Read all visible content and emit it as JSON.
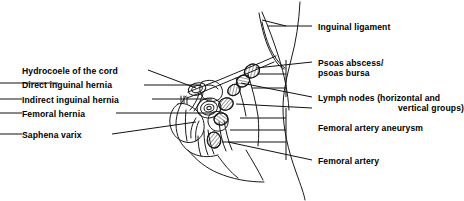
{
  "figure": {
    "title_visible": false,
    "kind": "anatomical-line-drawing",
    "colors": {
      "background": "#ffffff",
      "ink": "#1a1a1a",
      "leader_line": "#111111",
      "text": "#000000"
    },
    "line_width_px": 1.0
  },
  "labels": {
    "left": [
      {
        "id": "hydrocoele-of-the-cord",
        "text": "Hydrocoele of the cord",
        "x": 22,
        "y": 66,
        "leader": {
          "x1": 148,
          "y1": 70,
          "x2": 196,
          "y2": 88
        }
      },
      {
        "id": "direct-inguinal-hernia",
        "text": "Direct inguinal hernia",
        "x": 22,
        "y": 80,
        "leader": {
          "x1": 144,
          "y1": 85,
          "x2": 201,
          "y2": 85
        }
      },
      {
        "id": "indirect-inguinal-hernia",
        "text": "Indirect inguinal hernia",
        "x": 22,
        "y": 95,
        "leader": {
          "x1": 152,
          "y1": 99,
          "x2": 212,
          "y2": 99
        }
      },
      {
        "id": "femoral-hernia",
        "text": "Femoral hernia",
        "x": 22,
        "y": 109,
        "leader": {
          "x1": 116,
          "y1": 113,
          "x2": 214,
          "y2": 113
        }
      },
      {
        "id": "saphena-varix",
        "text": "Saphena varix",
        "x": 22,
        "y": 130,
        "leader": {
          "x1": 112,
          "y1": 134,
          "x2": 196,
          "y2": 122
        }
      }
    ],
    "right": [
      {
        "id": "inguinal-ligament",
        "lines": [
          "Inguinal ligament"
        ],
        "x": 318,
        "y": 22,
        "leader": {
          "x1": 300,
          "y1": 26,
          "x2": 268,
          "y2": 26
        }
      },
      {
        "id": "psoas-abscess-bursa",
        "lines": [
          "Psoas abscess/",
          "psoas bursa"
        ],
        "x": 318,
        "y": 58,
        "leader": {
          "x1": 300,
          "y1": 62,
          "x2": 256,
          "y2": 68
        }
      },
      {
        "id": "lymph-nodes",
        "lines": [
          "Lymph nodes (horizontal and",
          "vertical groups)"
        ],
        "x": 318,
        "y": 93,
        "indent_second_line": true,
        "leader": {
          "x1": 300,
          "y1": 97,
          "x2": 241,
          "y2": 83
        }
      },
      {
        "id": "femoral-artery-aneurysm",
        "lines": [
          "Femoral artery aneurysm"
        ],
        "x": 318,
        "y": 123,
        "leader": {
          "x1": 300,
          "y1": 108,
          "x2": 236,
          "y2": 104
        }
      },
      {
        "id": "femoral-artery",
        "lines": [
          "Femoral artery"
        ],
        "x": 318,
        "y": 156,
        "leader": {
          "x1": 300,
          "y1": 160,
          "x2": 228,
          "y2": 140
        }
      }
    ]
  },
  "drawing": {
    "structures": [
      "torso-flank-outline",
      "thigh-outline",
      "inguinal-crease-fold",
      "inguinal-ligament-band",
      "scrotum-outline",
      "spermatic-cord",
      "hydrocoele-sac",
      "direct-inguinal-hernia-bulge",
      "indirect-inguinal-hernia-bulge",
      "femoral-hernia-bulge",
      "saphena-varix",
      "psoas-bursa-node",
      "lymph-node-chain",
      "femoral-artery-aneurysm",
      "femoral-artery"
    ],
    "hatched_node_count": 6
  }
}
